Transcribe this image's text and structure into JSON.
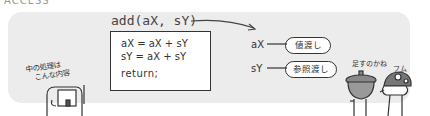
{
  "header": {
    "cropped_text": "ACCESS"
  },
  "diagram": {
    "function_signature": "add(aX, sY)",
    "code_lines": [
      "aX = aX + sY",
      "sY = aX + sY",
      "return;"
    ],
    "note": {
      "line1": "中の処理は",
      "line2": "こんな内容"
    },
    "parameters": [
      {
        "name": "aX",
        "label": "値渡し"
      },
      {
        "name": "sY",
        "label": "参照渡し"
      }
    ],
    "characters": [
      {
        "speech": "足すのかね"
      },
      {
        "speech": "フム"
      }
    ],
    "colors": {
      "panel_background": "#ececec",
      "line": "#333333",
      "box_background": "#ffffff"
    }
  }
}
